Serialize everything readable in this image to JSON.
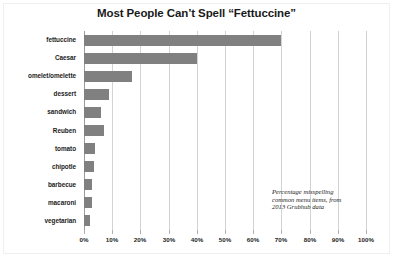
{
  "chart_data": {
    "type": "bar",
    "orientation": "horizontal",
    "title": "Most People Can’t Spell “Fettuccine”",
    "xlabel": "",
    "ylabel": "",
    "xlim": [
      0,
      100
    ],
    "x_tick_labels": [
      "0%",
      "10%",
      "20%",
      "30%",
      "40%",
      "50%",
      "60%",
      "70%",
      "80%",
      "90%",
      "100%"
    ],
    "x_tick_values": [
      0,
      10,
      20,
      30,
      40,
      50,
      60,
      70,
      80,
      90,
      100
    ],
    "grid": true,
    "legend": false,
    "bar_color": "#808080",
    "gridline_color": "#d3d3d3",
    "categories": [
      "fettuccine",
      "Caesar",
      "omelet/omelette",
      "dessert",
      "sandwich",
      "Reuben",
      "tomato",
      "chipotle",
      "barbecue",
      "macaroni",
      "vegetarian"
    ],
    "values": [
      70,
      40,
      17,
      9,
      6,
      7,
      4,
      3.5,
      3,
      3,
      2
    ],
    "annotation": {
      "lines": [
        "Percentage misspelling",
        "common menu items, from",
        "2013 Grubhub data"
      ]
    }
  }
}
